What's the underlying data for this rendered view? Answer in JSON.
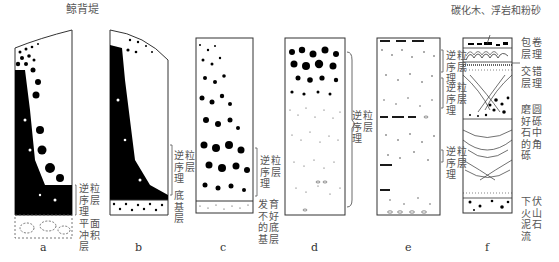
{
  "title": "鲸背堤",
  "top_note_f": "碳化木、浮岩和粉砂",
  "panels": [
    {
      "id": "a",
      "letter": "a",
      "labels": [
        "逆粒序层理",
        "平面冲积层"
      ]
    },
    {
      "id": "b",
      "letter": "b",
      "labels": [
        "逆粒序层理",
        "底基层"
      ]
    },
    {
      "id": "c",
      "letter": "c",
      "labels": [
        "逆粒序层理",
        "发育不好的底基层"
      ]
    },
    {
      "id": "d",
      "letter": "d",
      "labels": [
        "逆粒序层理"
      ]
    },
    {
      "id": "e",
      "letter": "e",
      "labels": [
        "逆粒序层理",
        "逆粒序层理",
        "逆粒序层理"
      ]
    },
    {
      "id": "f",
      "letter": "f",
      "labels_left": [
        "逆粒序层理",
        "逆粒序层理",
        "逆粒序层理"
      ],
      "labels_right": [
        "包卷层理",
        "交错层理",
        "磨圆好砾石中的角砾",
        "下伏火山泥石流"
      ]
    }
  ]
}
